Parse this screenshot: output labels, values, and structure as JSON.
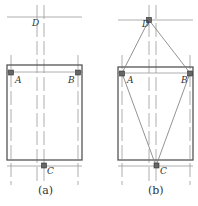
{
  "panels": [
    {
      "caption": "(a)",
      "labels": {
        "A": "A",
        "B": "B",
        "C": "C",
        "D": "D"
      }
    },
    {
      "caption": "(b)",
      "labels": {
        "A": "A",
        "B": "B",
        "C": "C",
        "D": "D"
      }
    }
  ],
  "colors": {
    "line": "#555555",
    "thin": "#999999",
    "marker": "#444444"
  }
}
